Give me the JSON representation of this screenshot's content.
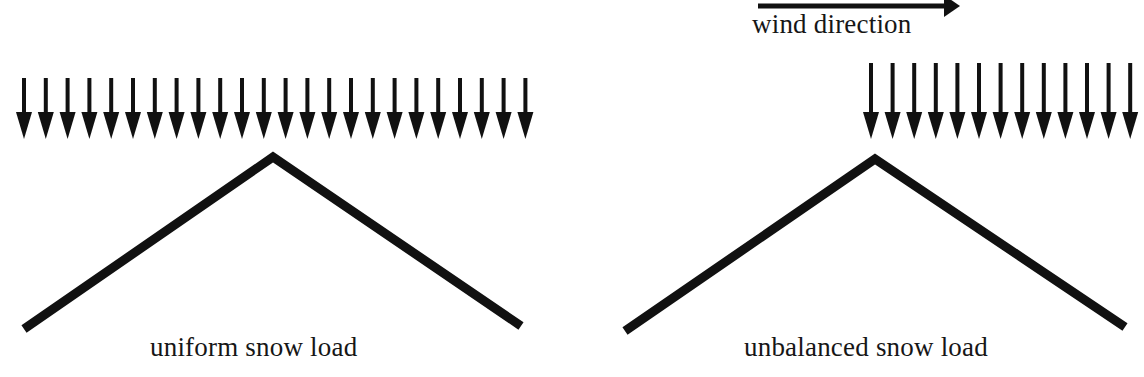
{
  "figure": {
    "background_color": "#ffffff",
    "ink_color": "#111111"
  },
  "panels": [
    {
      "id": "uniform",
      "caption": "uniform snow load",
      "roof": {
        "apex": [
          273,
          157
        ],
        "left_eave": [
          24,
          329
        ],
        "right_eave": [
          521,
          326
        ],
        "stroke_width": 9
      },
      "load_arrows": {
        "label": "uniform-snow-load-arrows",
        "count": 24,
        "first_x": 24,
        "spacing": 21.8,
        "top_y": 78,
        "tip_y": 139,
        "head_top_y": 112,
        "shaft_width": 4,
        "head_width": 16
      }
    },
    {
      "id": "unbalanced",
      "caption": "unbalanced snow load",
      "wind": {
        "label": "wind direction",
        "arrow_start_x": 198,
        "arrow_end_x": 400,
        "arrow_y": 6,
        "shaft_width": 5,
        "head_width": 22,
        "head_height": 16
      },
      "roof": {
        "apex": [
          315,
          159
        ],
        "left_eave": [
          65,
          331
        ],
        "right_eave": [
          565,
          327
        ],
        "stroke_width": 9
      },
      "load_arrows": {
        "label": "unbalanced-snow-load-arrows",
        "count": 13,
        "first_x": 311,
        "spacing": 21.6,
        "top_y": 63,
        "tip_y": 139,
        "head_top_y": 112,
        "shaft_width": 4,
        "head_width": 16
      }
    }
  ]
}
